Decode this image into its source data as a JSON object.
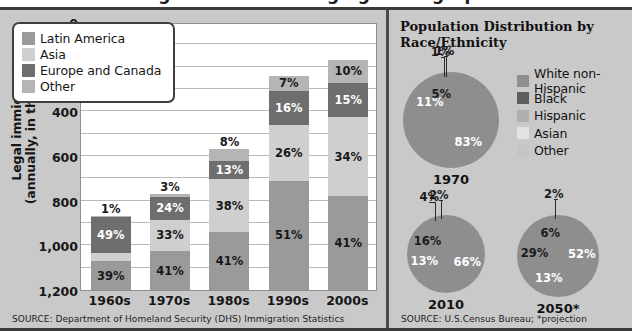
{
  "figure": {
    "clipped_title_fragment": "U.S. Immigration and Changing Demographics",
    "background": "#c9c9c9"
  },
  "colors": {
    "latin_america": "#9a9a9a",
    "asia": "#cfcfcf",
    "europe_canada": "#6e6e6e",
    "other": "#b5b5b5",
    "white_non_hispanic": "#8e8e8e",
    "black": "#5e5e5e",
    "hispanic": "#b0b0b0",
    "asian": "#e2e2e2",
    "other_race": "#c4c4c4",
    "plot_background": "#ffffff",
    "gridline": "#b9b9b9",
    "text": "#171717"
  },
  "left_panel": {
    "y_axis_title_line1": "Legal immigrants",
    "y_axis_title_line2": "(annually, in thousands)",
    "y_ticks": [
      "1,200",
      "1,000",
      "800",
      "600",
      "400",
      "200",
      "0"
    ],
    "legend": [
      {
        "label": "Latin America",
        "color": "#9a9a9a"
      },
      {
        "label": "Asia",
        "color": "#cfcfcf"
      },
      {
        "label": "Europe and Canada",
        "color": "#6e6e6e"
      },
      {
        "label": "Other",
        "color": "#b5b5b5"
      }
    ],
    "source": "SOURCE: Department of Homeland Security (DHS) Immigration Statistics"
  },
  "right_panel": {
    "title_line1": "Population Distribution by",
    "title_line2": "Race/Ethnicity",
    "legend": [
      {
        "label": "White non-Hispanic",
        "color": "#8e8e8e"
      },
      {
        "label": "Black",
        "color": "#5e5e5e"
      },
      {
        "label": "Hispanic",
        "color": "#b0b0b0"
      },
      {
        "label": "Asian",
        "color": "#e2e2e2"
      },
      {
        "label": "Other",
        "color": "#c4c4c4"
      }
    ],
    "source": "SOURCE: U.S.Census Bureau; *projection"
  },
  "chart_data": [
    {
      "type": "bar",
      "subtype": "stacked-column",
      "title": "Legal immigrants by region of origin",
      "xlabel": "",
      "ylabel": "Legal immigrants (annually, in thousands)",
      "ylim": [
        0,
        1200
      ],
      "ytick_values": [
        0,
        200,
        400,
        600,
        800,
        1000,
        1200
      ],
      "ytick_labels": [
        "0",
        "200",
        "400",
        "600",
        "800",
        "1,000",
        "1,200"
      ],
      "minor_gridline_interval": 100,
      "grid": true,
      "legend_position": "inside-top-left",
      "categories": [
        "1960s",
        "1970s",
        "1980s",
        "1990s",
        "2000s"
      ],
      "totals": [
        330,
        430,
        630,
        960,
        1030
      ],
      "series": [
        {
          "name": "Latin America",
          "color": "#9a9a9a",
          "percent_labels": [
            "39%",
            "41%",
            "41%",
            "51%",
            "41%"
          ],
          "values": [
            39,
            41,
            41,
            51,
            41
          ]
        },
        {
          "name": "Asia",
          "color": "#cfcfcf",
          "percent_labels": [
            "11%",
            "33%",
            "38%",
            "26%",
            "34%"
          ],
          "values": [
            11,
            33,
            38,
            26,
            34
          ]
        },
        {
          "name": "Europe and Canada",
          "color": "#6e6e6e",
          "percent_labels": [
            "49%",
            "24%",
            "13%",
            "16%",
            "15%"
          ],
          "values": [
            49,
            24,
            13,
            16,
            15
          ]
        },
        {
          "name": "Other",
          "color": "#b5b5b5",
          "percent_labels": [
            "1%",
            "3%",
            "8%",
            "7%",
            "10%"
          ],
          "values": [
            1,
            3,
            8,
            7,
            10
          ]
        }
      ],
      "source": "SOURCE: Department of Homeland Security (DHS) Immigration Statistics"
    },
    {
      "type": "pie",
      "title": "1970",
      "labels": [
        "White non-Hispanic",
        "Black",
        "Hispanic",
        "Asian",
        "Other"
      ],
      "values": [
        83,
        11,
        5,
        1,
        1
      ],
      "value_labels": [
        "83%",
        "11%",
        "5%",
        "1%",
        "1%"
      ],
      "colors": [
        "#8e8e8e",
        "#5e5e5e",
        "#b0b0b0",
        "#e2e2e2",
        "#c4c4c4"
      ]
    },
    {
      "type": "pie",
      "title": "2010",
      "labels": [
        "White non-Hispanic",
        "Black",
        "Hispanic",
        "Asian",
        "Other"
      ],
      "values": [
        66,
        13,
        16,
        4,
        2
      ],
      "value_labels": [
        "66%",
        "13%",
        "16%",
        "4%",
        "2%"
      ],
      "colors": [
        "#8e8e8e",
        "#5e5e5e",
        "#b0b0b0",
        "#e2e2e2",
        "#c4c4c4"
      ]
    },
    {
      "type": "pie",
      "title": "2050*",
      "labels": [
        "White non-Hispanic",
        "Black",
        "Hispanic",
        "Asian",
        "Other"
      ],
      "values": [
        52,
        13,
        29,
        6,
        2
      ],
      "value_labels": [
        "52%",
        "13%",
        "29%",
        "6%",
        "2%"
      ],
      "colors": [
        "#8e8e8e",
        "#5e5e5e",
        "#b0b0b0",
        "#e2e2e2",
        "#c4c4c4"
      ]
    }
  ]
}
